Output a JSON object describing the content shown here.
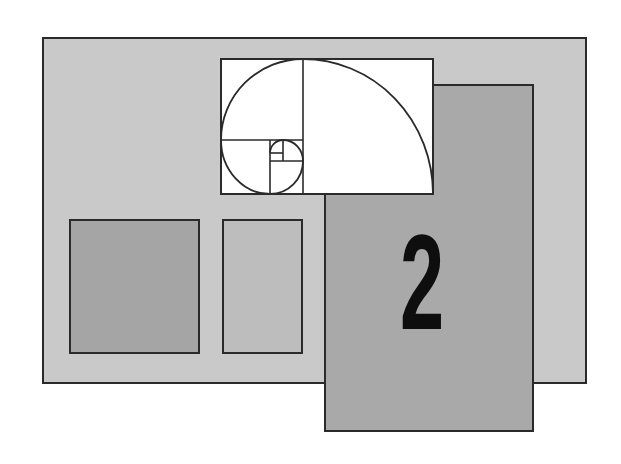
{
  "diagram": {
    "colors": {
      "background": "#ffffff",
      "outer_panel": "#c9c9c9",
      "tall_panel": "#a9a9a9",
      "left_square": "#a5a5a5",
      "middle_panel": "#bdbdbd",
      "golden_rect": "#ffffff",
      "stroke": "#2a2a2a",
      "numeral": "#0e0e0e"
    },
    "shapes": {
      "outer_panel": {
        "x": 42,
        "y": 37,
        "w": 545,
        "h": 347
      },
      "left_square": {
        "x": 69,
        "y": 219,
        "w": 131,
        "h": 135
      },
      "middle_panel": {
        "x": 222,
        "y": 219,
        "w": 81,
        "h": 135
      },
      "tall_panel": {
        "x": 324,
        "y": 84,
        "w": 210,
        "h": 348
      },
      "golden_rect": {
        "x": 221,
        "y": 59,
        "w": 212,
        "h": 135
      }
    },
    "numeral": "2"
  }
}
